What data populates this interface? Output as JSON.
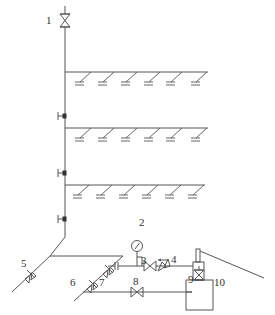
{
  "diagram": {
    "type": "fire sprinkler piping system schematic",
    "colors": {
      "line": "#555555",
      "background": "#ffffff",
      "label": "#333333"
    },
    "labels": [
      {
        "id": "1",
        "text": "1",
        "x": 46,
        "y": 24
      },
      {
        "id": "2",
        "text": "2",
        "x": 139,
        "y": 225
      },
      {
        "id": "3",
        "text": "3",
        "x": 142,
        "y": 263
      },
      {
        "id": "4",
        "text": "4",
        "x": 172,
        "y": 262
      },
      {
        "id": "5",
        "text": "5",
        "x": 22,
        "y": 266
      },
      {
        "id": "6",
        "text": "6",
        "x": 71,
        "y": 285
      },
      {
        "id": "7",
        "text": "7",
        "x": 100,
        "y": 285
      },
      {
        "id": "8",
        "text": "8",
        "x": 133,
        "y": 284
      },
      {
        "id": "9",
        "text": "9",
        "x": 189,
        "y": 281
      },
      {
        "id": "10",
        "text": "10",
        "x": 214,
        "y": 284
      }
    ],
    "riser": {
      "x": 65,
      "top": 8,
      "bottom": 237
    },
    "branches": [
      {
        "floor": 1,
        "y": 72,
        "x1": 65,
        "x2": 208,
        "sprinklers": 6
      },
      {
        "floor": 2,
        "y": 128,
        "x1": 65,
        "x2": 208,
        "sprinklers": 6
      },
      {
        "floor": 3,
        "y": 185,
        "x1": 65,
        "x2": 208,
        "sprinklers": 6
      }
    ],
    "riser_marks_y": [
      116,
      173,
      219
    ],
    "components": [
      {
        "id": "1",
        "name": "gate-valve",
        "x": 65,
        "y": 20
      },
      {
        "id": "3",
        "name": "valve",
        "x": 150,
        "y": 266
      },
      {
        "id": "4",
        "name": "check-valve",
        "x": 168,
        "y": 266
      },
      {
        "id": "5",
        "name": "check-valve",
        "x": 31,
        "y": 274
      },
      {
        "id": "6",
        "name": "check-valve",
        "x": 92,
        "y": 284
      },
      {
        "id": "7",
        "name": "check-valve",
        "x": 109,
        "y": 269
      },
      {
        "id": "8",
        "name": "valve",
        "x": 137,
        "y": 292
      },
      {
        "id": "9",
        "name": "drain-valve",
        "x": 199,
        "y": 275
      },
      {
        "id": "10",
        "name": "pressure-tank",
        "x": 199,
        "y": 285
      },
      {
        "id": "gauge",
        "name": "pressure-gauge",
        "x": 137,
        "y": 247
      }
    ]
  }
}
